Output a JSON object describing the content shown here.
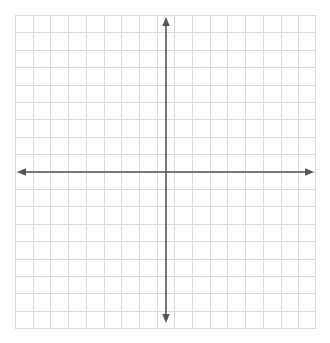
{
  "figure": {
    "kind": "blank-cartesian-coordinate-plane",
    "title": "",
    "background_color": "#ffffff"
  },
  "grid": {
    "line_color": "#d9d9d9",
    "columns": 17,
    "rows": 18,
    "cell_width_px": 17.7,
    "cell_height_px": 17.4,
    "left_px": 15,
    "top_px": 15,
    "width_px": 301,
    "height_px": 314,
    "show_grid": true,
    "show_tick_labels": false,
    "show_axis_labels": false
  },
  "axes": {
    "color": "#555555",
    "stroke_width_px": 1.6,
    "origin_x_px": 166,
    "origin_y_px": 172,
    "x_axis": {
      "name": "x-axis",
      "label": "",
      "start_px": 17,
      "end_px": 314,
      "arrow_start": true,
      "arrow_end": true,
      "tick_labels": []
    },
    "y_axis": {
      "name": "y-axis",
      "label": "",
      "start_px": 17,
      "end_px": 323,
      "arrow_start": true,
      "arrow_end": true,
      "tick_labels": []
    }
  },
  "chart_data": {
    "type": "scatter",
    "title": "",
    "xlabel": "",
    "ylabel": "",
    "series": [],
    "x": [],
    "values": [],
    "annotations": [],
    "legend": [],
    "grid": true,
    "xlim": [
      -9,
      8
    ],
    "ylim": [
      -9,
      9
    ],
    "xticks": [],
    "yticks": [],
    "note": "Empty graph paper: no plotted data, no tick numbers, no labels."
  }
}
